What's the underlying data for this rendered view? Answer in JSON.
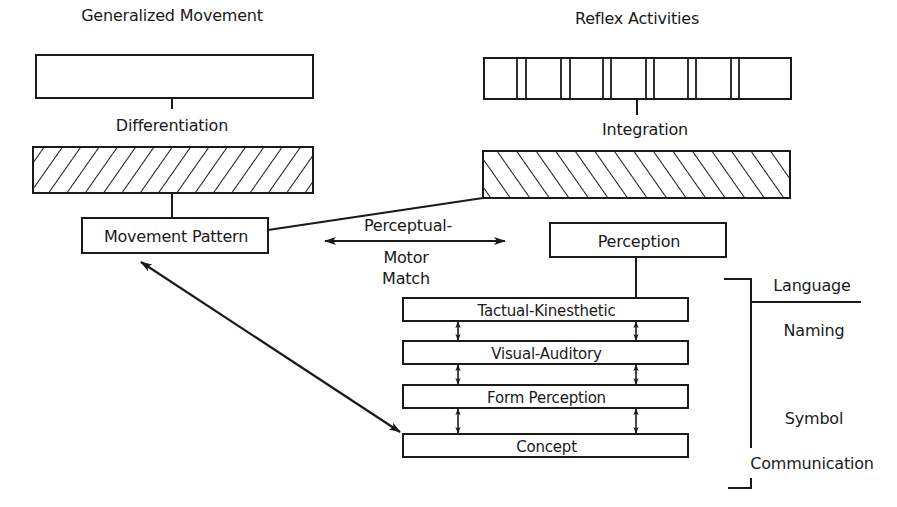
{
  "diagram": {
    "left_column": {
      "top_box_label": "Generalized Movement",
      "process_label": "Differentiation",
      "result_box_label": "Movement Pattern"
    },
    "right_column": {
      "top_box_label": "Reflex Activities",
      "reflex_segments": 7,
      "process_label": "Integration",
      "result_box_label": "Perception"
    },
    "match": {
      "line1": "Perceptual-",
      "line2": "Motor",
      "line3": "Match"
    },
    "perception_stack": [
      {
        "label": "Tactual-Kinesthetic"
      },
      {
        "label": "Visual-Auditory"
      },
      {
        "label": "Form Perception"
      },
      {
        "label": "Concept"
      }
    ],
    "language_bracket": {
      "top": "Language",
      "items": [
        "Naming",
        "Symbol",
        "Communication"
      ]
    },
    "colors": {
      "ink": "#1a1a1a",
      "background": "#ffffff"
    }
  }
}
